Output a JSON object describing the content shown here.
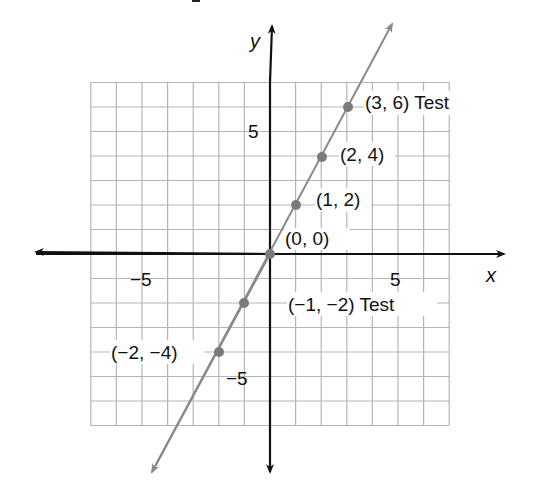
{
  "chart_data": {
    "type": "line",
    "title": "",
    "xlabel": "x",
    "ylabel": "y",
    "xlim": [
      -7,
      7
    ],
    "ylim": [
      -7,
      7
    ],
    "grid": true,
    "x_ticks": [
      {
        "value": -5,
        "label": "−5"
      },
      {
        "value": 5,
        "label": "5"
      }
    ],
    "y_ticks": [
      {
        "value": 5,
        "label": "5"
      },
      {
        "value": -5,
        "label": "−5"
      }
    ],
    "series": [
      {
        "name": "y = 2x",
        "color": "#8a8a8a",
        "points": [
          {
            "x": -2,
            "y": -4,
            "label": "(−2, −4)"
          },
          {
            "x": -1,
            "y": -2,
            "label": "(−1, −2) Test"
          },
          {
            "x": 0,
            "y": 0,
            "label": "(0, 0)"
          },
          {
            "x": 1,
            "y": 2,
            "label": "(1, 2)"
          },
          {
            "x": 2,
            "y": 4,
            "label": "(2, 4)"
          },
          {
            "x": 3,
            "y": 6,
            "label": "(3, 6) Test"
          }
        ]
      }
    ]
  },
  "axes": {
    "x_label": "x",
    "y_label": "y",
    "axis_color": "#111111",
    "grid_color": "#b5b5b5",
    "line_color": "#8a8a8a",
    "point_color": "#7a7a7a"
  }
}
